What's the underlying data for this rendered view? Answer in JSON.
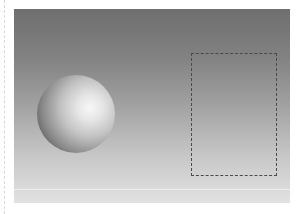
{
  "scene": {
    "description": "3D-rendered sphere on a gray gradient backdrop with a dashed selection rectangle",
    "objects": [
      {
        "type": "sphere",
        "shading": "lit from right",
        "label": ""
      },
      {
        "type": "selection-rectangle",
        "style": "dashed",
        "label": ""
      }
    ],
    "colors": {
      "backdrop_top": "#6e6e6e",
      "backdrop_bottom": "#e2e2e2",
      "selection_border": "#4a4a4a",
      "sphere_highlight": "#f7f7f7",
      "sphere_shadow": "#3a3a3a"
    }
  }
}
